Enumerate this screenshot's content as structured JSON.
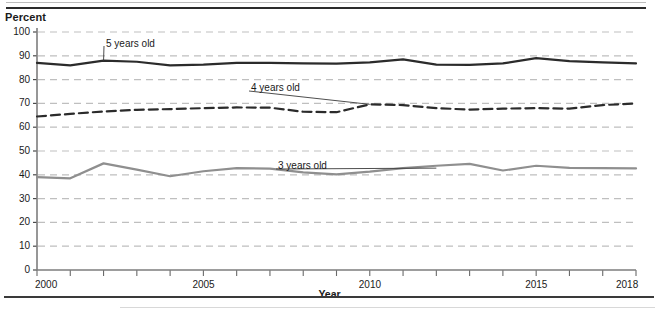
{
  "chart_data": {
    "type": "line",
    "title": "",
    "ylabel": "Percent",
    "xlabel": "Year",
    "ylim": [
      0,
      100
    ],
    "xlim": [
      2000,
      2018
    ],
    "grid": true,
    "grid_style": "dashed-horizontal",
    "legend_position": "inline-callouts",
    "y_ticks": [
      0,
      10,
      20,
      30,
      40,
      50,
      60,
      70,
      80,
      90,
      100
    ],
    "y_tick_labels": [
      "0",
      "10",
      "20",
      "30",
      "40",
      "50",
      "60",
      "70",
      "80",
      "90",
      "100"
    ],
    "x": [
      2000,
      2001,
      2002,
      2003,
      2004,
      2005,
      2006,
      2007,
      2008,
      2009,
      2010,
      2011,
      2012,
      2013,
      2014,
      2015,
      2016,
      2017,
      2018
    ],
    "x_tick_labels_shown": [
      "2000",
      "2005",
      "2010",
      "2015",
      "2018"
    ],
    "x_tick_label_values": [
      2000,
      2005,
      2010,
      2015,
      2018
    ],
    "series": [
      {
        "name": "5 years old",
        "label": "5 years old",
        "color": "#2b2b2b",
        "style": "solid",
        "width": 2.2,
        "values": [
          87.0,
          86.0,
          88.0,
          87.5,
          86.0,
          86.3,
          87.0,
          87.0,
          86.8,
          86.7,
          87.2,
          88.5,
          86.3,
          86.2,
          86.8,
          89.0,
          87.8,
          87.2,
          86.8
        ]
      },
      {
        "name": "4 years old",
        "label": "4 years old",
        "color": "#2b2b2b",
        "style": "dashed",
        "width": 2.2,
        "values": [
          64.5,
          65.6,
          66.6,
          67.3,
          67.6,
          68.0,
          68.3,
          68.2,
          66.5,
          66.3,
          69.6,
          69.3,
          68.0,
          67.4,
          67.8,
          68.0,
          67.8,
          69.3,
          70.0
        ]
      },
      {
        "name": "3 years old",
        "label": "3 years old",
        "color": "#8f8f8f",
        "style": "solid",
        "width": 2.2,
        "values": [
          39.0,
          38.5,
          44.8,
          42.2,
          39.4,
          41.5,
          42.8,
          42.6,
          41.0,
          40.2,
          41.3,
          42.8,
          43.8,
          44.6,
          41.8,
          43.8,
          42.9,
          42.8,
          42.7
        ]
      }
    ],
    "annotations": [
      {
        "text": "5 years old",
        "series": "5 years old",
        "leader_from_year": 2002,
        "leader_from_value": 88.0
      },
      {
        "text": "4 years old",
        "series": "4 years old",
        "leader_from_year": 2010,
        "leader_from_value": 69.6
      },
      {
        "text": "3 years old",
        "series": "3 years old",
        "leader_from_year": 2012,
        "leader_from_value": 42.8
      }
    ]
  },
  "labels": {
    "y_axis_title": "Percent",
    "x_axis_title": "Year",
    "callout_5": "5 years old",
    "callout_4": "4 years old",
    "callout_3": "3 years old"
  },
  "footnote": {
    "text": ""
  }
}
